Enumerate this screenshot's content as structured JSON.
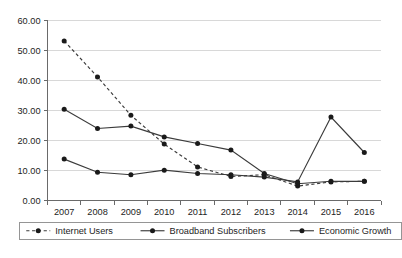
{
  "chart_data": {
    "type": "line",
    "title": "",
    "subtitle": "",
    "xlabel": "",
    "ylabel": "",
    "categories": [
      "2007",
      "2008",
      "2009",
      "2010",
      "2011",
      "2012",
      "2013",
      "2014",
      "2015",
      "2016"
    ],
    "x": [
      2007,
      2008,
      2009,
      2010,
      2011,
      2012,
      2013,
      2014,
      2015,
      2016
    ],
    "ylim": [
      0,
      60
    ],
    "ytick_labels": [
      "0.00",
      "10.00",
      "20.00",
      "30.00",
      "40.00",
      "50.00",
      "60.00"
    ],
    "ytick_values": [
      0,
      10,
      20,
      30,
      40,
      50,
      60
    ],
    "grid": true,
    "legend_position": "bottom",
    "series": [
      {
        "name": "Internet Users",
        "style": "dashed",
        "marker": "circle",
        "values": [
          53.2,
          41.2,
          28.4,
          18.8,
          11.2,
          8.0,
          8.6,
          4.8,
          6.2,
          6.4
        ]
      },
      {
        "name": "Broadband Subscribers",
        "style": "solid",
        "marker": "circle",
        "values": [
          30.4,
          24.0,
          24.8,
          21.2,
          19.0,
          16.8,
          9.0,
          5.6,
          6.4,
          6.4
        ]
      },
      {
        "name": "Economic Growth",
        "style": "solid",
        "marker": "circle",
        "values": [
          13.8,
          9.4,
          8.6,
          10.1,
          9.0,
          8.6,
          7.8,
          6.2,
          27.8,
          16.0
        ]
      }
    ]
  },
  "legend": {
    "items": [
      {
        "label": "Internet Users",
        "style": "dashed"
      },
      {
        "label": "Broadband Subscribers",
        "style": "solid"
      },
      {
        "label": "Economic Growth",
        "style": "solid"
      }
    ]
  },
  "colors": {
    "series": "#1a1a1a",
    "grid": "#d8d8d8",
    "axis": "#6a6a6a",
    "background": "#ffffff"
  }
}
